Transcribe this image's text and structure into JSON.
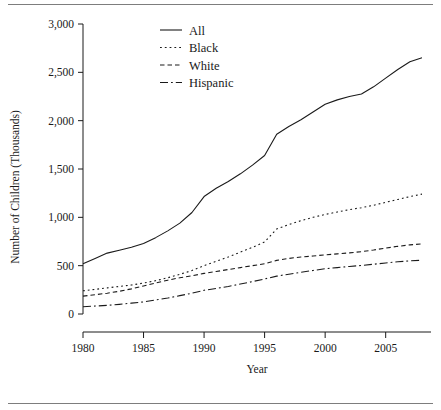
{
  "chart_data": {
    "type": "line",
    "title": "",
    "xlabel": "Year",
    "ylabel": "Number of Children (Thousands)",
    "xlim": [
      1980,
      2008
    ],
    "ylim": [
      0,
      3000
    ],
    "grid": false,
    "legend_position": "top-center",
    "xticks": [
      "1980",
      "1985",
      "1990",
      "1995",
      "2000",
      "2005"
    ],
    "xtick_values": [
      1980,
      1985,
      1990,
      1995,
      2000,
      2005
    ],
    "yticks": [
      "0",
      "500",
      "1,000",
      "1,500",
      "2,000",
      "2,500",
      "3,000"
    ],
    "ytick_values": [
      0,
      500,
      1000,
      1500,
      2000,
      2500,
      3000
    ],
    "x": [
      1980,
      1981,
      1982,
      1983,
      1984,
      1985,
      1986,
      1987,
      1988,
      1989,
      1990,
      1991,
      1992,
      1993,
      1994,
      1995,
      1996,
      1997,
      1998,
      1999,
      2000,
      2001,
      2002,
      2003,
      2004,
      2005,
      2006,
      2007,
      2008
    ],
    "series": [
      {
        "name": "All",
        "linestyle": "solid",
        "dash": "none",
        "color": "#1a1a1a",
        "values": [
          520,
          575,
          630,
          660,
          690,
          730,
          790,
          860,
          940,
          1050,
          1215,
          1300,
          1370,
          1450,
          1540,
          1640,
          1860,
          1940,
          2010,
          2090,
          2170,
          2215,
          2250,
          2275,
          2350,
          2440,
          2530,
          2610,
          2650
        ]
      },
      {
        "name": "Black",
        "linestyle": "dotted",
        "dash": "1.8 3.0",
        "color": "#1a1a1a",
        "values": [
          240,
          255,
          270,
          285,
          300,
          320,
          345,
          375,
          410,
          450,
          500,
          545,
          590,
          640,
          690,
          745,
          880,
          925,
          965,
          1000,
          1030,
          1055,
          1080,
          1100,
          1125,
          1155,
          1185,
          1215,
          1240
        ]
      },
      {
        "name": "White",
        "linestyle": "dashed",
        "dash": "4.5 3.0",
        "color": "#1a1a1a",
        "values": [
          185,
          200,
          215,
          235,
          260,
          290,
          320,
          350,
          375,
          395,
          420,
          440,
          460,
          480,
          500,
          520,
          555,
          575,
          590,
          600,
          612,
          622,
          632,
          645,
          662,
          682,
          700,
          715,
          725
        ]
      },
      {
        "name": "Hispanic",
        "linestyle": "dashdot",
        "dash": "8 3 1.8 3",
        "color": "#1a1a1a",
        "values": [
          75,
          82,
          90,
          100,
          112,
          125,
          145,
          165,
          190,
          215,
          245,
          265,
          285,
          310,
          335,
          362,
          392,
          412,
          432,
          450,
          468,
          480,
          492,
          502,
          515,
          528,
          540,
          550,
          556
        ]
      }
    ]
  },
  "legend": {
    "items": [
      {
        "label": "All"
      },
      {
        "label": "Black"
      },
      {
        "label": "White"
      },
      {
        "label": "Hispanic"
      }
    ]
  },
  "axes": {
    "x_title": "Year",
    "y_title": "Number of Children (Thousands)"
  },
  "colors": {
    "ink": "#1a1a1a",
    "rule": "#7d7d7d",
    "background": "#ffffff"
  }
}
